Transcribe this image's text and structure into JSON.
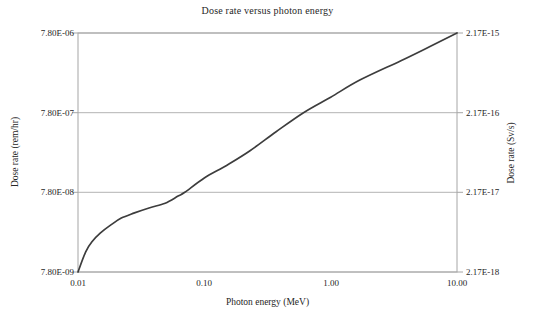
{
  "chart_data": {
    "type": "line",
    "title": "Dose rate versus photon energy",
    "xlabel": "Photon energy (MeV)",
    "ylabel_left": "Dose rate (rem/hr)",
    "ylabel_right": "Dose rate (Sv/s)",
    "xscale": "log",
    "yscale": "log",
    "xlim": [
      0.01,
      10
    ],
    "ylim_left": [
      7.8e-09,
      7.8e-06
    ],
    "ylim_right": [
      2.17e-18,
      2.17e-15
    ],
    "grid": "horizontal-only",
    "legend": "none",
    "x_ticks": {
      "values": [
        0.01,
        0.1,
        1,
        10
      ],
      "labels": [
        "0.01",
        "0.10",
        "1.00",
        "10.00"
      ]
    },
    "y_ticks_left": {
      "values": [
        7.8e-06,
        7.8e-07,
        7.8e-08,
        7.8e-09
      ],
      "labels": [
        "7.80E-06",
        "7.80E-07",
        "7.80E-08",
        "7.80E-09"
      ]
    },
    "y_ticks_right": {
      "labels": [
        "2.17E-15",
        "2.17E-16",
        "2.17E-17",
        "2.17E-18"
      ]
    },
    "series": [
      {
        "name": "dose rate",
        "color": "#3d3d3d",
        "points": [
          [
            0.01,
            7.8e-09
          ],
          [
            0.0115,
            1.4e-08
          ],
          [
            0.013,
            1.9e-08
          ],
          [
            0.015,
            2.4e-08
          ],
          [
            0.018,
            3e-08
          ],
          [
            0.022,
            3.7e-08
          ],
          [
            0.028,
            4.3e-08
          ],
          [
            0.037,
            5e-08
          ],
          [
            0.049,
            5.7e-08
          ],
          [
            0.062,
            7e-08
          ],
          [
            0.07,
            7.8e-08
          ],
          [
            0.1,
            1.18e-07
          ],
          [
            0.15,
            1.7e-07
          ],
          [
            0.23,
            2.6e-07
          ],
          [
            0.37,
            4.5e-07
          ],
          [
            0.61,
            7.8e-07
          ],
          [
            1.0,
            1.22e-06
          ],
          [
            1.7,
            2e-06
          ],
          [
            3.6,
            3.5e-06
          ],
          [
            6.0,
            5.2e-06
          ],
          [
            10.0,
            7.8e-06
          ]
        ]
      }
    ],
    "colors": {
      "grid": "#b3b3b3",
      "axis": "#a6a6a6",
      "text": "#262626",
      "background": "#ffffff"
    }
  }
}
